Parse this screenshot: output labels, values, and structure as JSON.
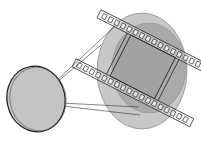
{
  "diagram": {
    "type": "illustration",
    "elements": [
      {
        "name": "lens",
        "shape": "ellipse"
      },
      {
        "name": "image-circle-outer",
        "shape": "ellipse"
      },
      {
        "name": "image-circle-inner",
        "shape": "ellipse"
      },
      {
        "name": "film-strip",
        "shape": "perforated strip"
      },
      {
        "name": "film-frame",
        "shape": "rectangle"
      },
      {
        "name": "projection-lines",
        "shape": "lines"
      }
    ],
    "colors": {
      "background": "#ffffff",
      "lens_fill": "#c4c4c4",
      "outer_circle": "#c8c8c8",
      "inner_circle": "#a9a9a9",
      "frame_fill": "#9c9c9c",
      "stroke": "#1e1e1e"
    }
  }
}
